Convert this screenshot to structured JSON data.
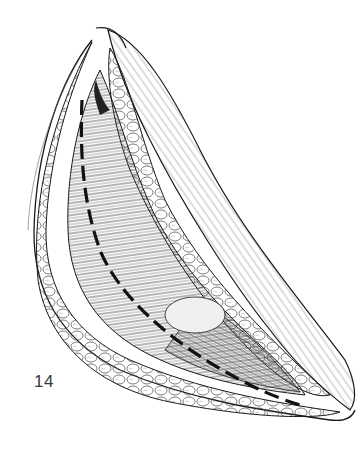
{
  "figure": {
    "label": "14",
    "colors": {
      "ink": "#1a1a1a",
      "fat_fill": "#f4f4f4",
      "muscle_fill": "#e2e2e2",
      "background": "#ffffff"
    }
  }
}
